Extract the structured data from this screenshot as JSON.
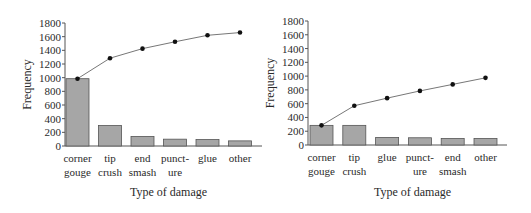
{
  "chart_data": [
    {
      "type": "bar",
      "subtype": "pareto",
      "title": "",
      "xlabel": "Type of damage",
      "ylabel": "Frequency",
      "ylim": [
        0,
        1800
      ],
      "yticks": [
        0,
        200,
        400,
        600,
        800,
        1000,
        1200,
        1400,
        1600,
        1800
      ],
      "grid": false,
      "legend": "none",
      "categories": [
        "corner gouge",
        "tip crush",
        "end smash",
        "punct-ure",
        "glue",
        "other"
      ],
      "category_lines": [
        [
          "corner",
          "gouge"
        ],
        [
          "tip",
          "crush"
        ],
        [
          "end",
          "smash"
        ],
        [
          "punct-",
          "ure"
        ],
        [
          "glue",
          ""
        ],
        [
          "other",
          ""
        ]
      ],
      "series": [
        {
          "name": "Frequency",
          "type": "bar",
          "values": [
            985,
            300,
            140,
            100,
            95,
            75
          ]
        },
        {
          "name": "Cumulative frequency",
          "type": "line",
          "values": [
            985,
            1285,
            1425,
            1525,
            1620,
            1660
          ]
        }
      ]
    },
    {
      "type": "bar",
      "subtype": "pareto",
      "title": "",
      "xlabel": "Type of damage",
      "ylabel": "Frequency",
      "ylim": [
        0,
        1800
      ],
      "yticks": [
        0,
        200,
        400,
        600,
        800,
        1000,
        1200,
        1400,
        1600,
        1800
      ],
      "grid": false,
      "legend": "none",
      "categories": [
        "corner gouge",
        "tip crush",
        "glue",
        "punct-ure",
        "end smash",
        "other"
      ],
      "category_lines": [
        [
          "corner",
          "gouge"
        ],
        [
          "tip",
          "crush"
        ],
        [
          "glue",
          ""
        ],
        [
          "punct-",
          "ure"
        ],
        [
          "end",
          "smash"
        ],
        [
          "other",
          ""
        ]
      ],
      "series": [
        {
          "name": "Frequency",
          "type": "bar",
          "values": [
            285,
            285,
            110,
            105,
            95,
            95
          ]
        },
        {
          "name": "Cumulative frequency",
          "type": "line",
          "values": [
            285,
            570,
            680,
            785,
            880,
            975
          ]
        }
      ]
    }
  ],
  "colors": {
    "bar_fill": "#a6a6a6",
    "bar_stroke": "#555555",
    "line": "#777777",
    "marker": "#111111",
    "axis": "#555555"
  }
}
